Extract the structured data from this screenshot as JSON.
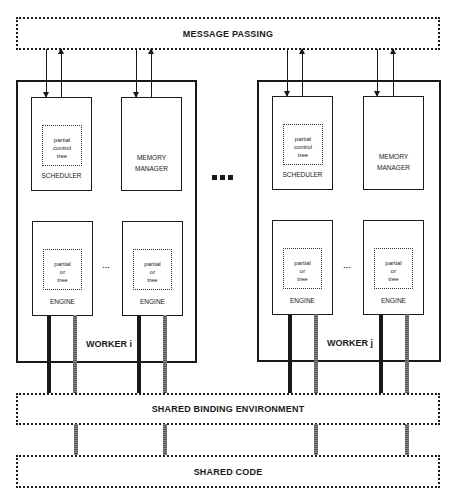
{
  "diagram": {
    "message_bus": {
      "label": "MESSAGE PASSING"
    },
    "binding_bus": {
      "label": "SHARED BINDING ENVIRONMENT"
    },
    "code_bus": {
      "label": "SHARED CODE"
    },
    "workers": [
      {
        "label": "WORKER i",
        "scheduler": {
          "label": "SCHEDULER",
          "inner": [
            "partial",
            "control",
            "tree"
          ]
        },
        "memory_manager": {
          "label_line1": "MEMORY",
          "label_line2": "MANAGER"
        },
        "engines": [
          {
            "label": "ENGINE",
            "inner": [
              "partial",
              "or",
              "tree"
            ]
          },
          {
            "label": "ENGINE",
            "inner": [
              "partial",
              "or",
              "tree"
            ]
          }
        ],
        "engine_ellipsis": "…"
      },
      {
        "label": "WORKER j",
        "scheduler": {
          "label": "SCHEDULER",
          "inner": [
            "partial",
            "control",
            "tree"
          ]
        },
        "memory_manager": {
          "label_line1": "MEMORY",
          "label_line2": "MANAGER"
        },
        "engines": [
          {
            "label": "ENGINE",
            "inner": [
              "partial",
              "or",
              "tree"
            ]
          },
          {
            "label": "ENGINE",
            "inner": [
              "partial",
              "or",
              "tree"
            ]
          }
        ],
        "engine_ellipsis": "…"
      }
    ],
    "workers_ellipsis": "■■■",
    "colors": {
      "line": "#1a1a1a",
      "background": "#ffffff",
      "gray_bar": "#777777"
    }
  }
}
